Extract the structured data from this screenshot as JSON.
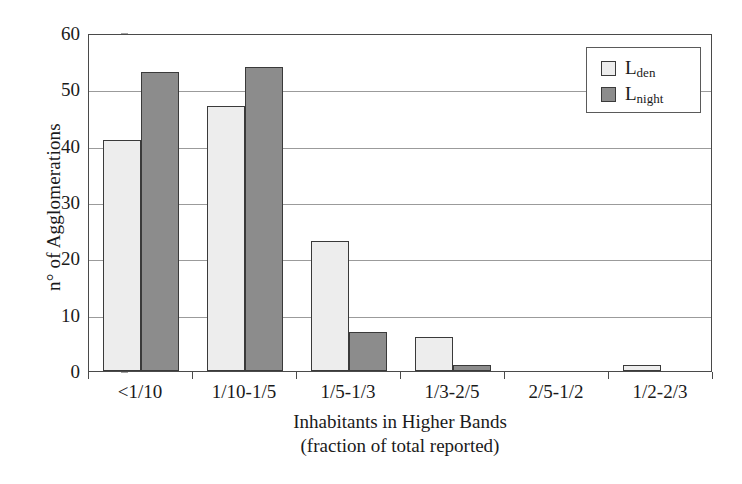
{
  "chart_data": {
    "type": "bar",
    "title": "",
    "xlabel": "Inhabitants in Higher Bands",
    "xlabel_line2": "(fraction of total reported)",
    "ylabel": "n° of Agglomerations",
    "ylim": [
      0,
      60
    ],
    "ytick_step": 10,
    "yticks": [
      0,
      10,
      20,
      30,
      40,
      50,
      60
    ],
    "ytick_labels": [
      "0",
      "10",
      "20",
      "30",
      "40",
      "50",
      "60"
    ],
    "grid": true,
    "grid_axis": "y",
    "legend_position": "top-right",
    "categories": [
      "<1/10",
      "1/10-1/5",
      "1/5-1/3",
      "1/3-2/5",
      "2/5-1/2",
      "1/2-2/3"
    ],
    "series": [
      {
        "name": "Lden",
        "legend_base": "L",
        "legend_sub": "den",
        "color": "#ededed",
        "edge_color": "#3a3a3a",
        "values": [
          41,
          47,
          23,
          6,
          0,
          1
        ]
      },
      {
        "name": "Lnight",
        "legend_base": "L",
        "legend_sub": "night",
        "color": "#8c8c8c",
        "edge_color": "#3a3a3a",
        "values": [
          53,
          54,
          7,
          1,
          0,
          0
        ]
      }
    ]
  },
  "axis": {
    "frame_color": "#4a4a4a",
    "gridline_color": "#9b9b9b"
  }
}
